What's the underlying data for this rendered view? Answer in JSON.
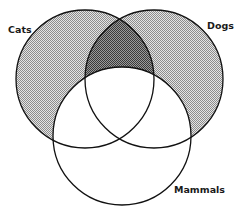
{
  "diagram": {
    "type": "venn",
    "sets": [
      {
        "id": "cats",
        "label": "Cats",
        "shaded": true
      },
      {
        "id": "dogs",
        "label": "Dogs",
        "shaded": true
      },
      {
        "id": "mammals",
        "label": "Mammals",
        "shaded": false
      }
    ],
    "regions": [
      {
        "sets": [
          "cats"
        ],
        "shading": "light"
      },
      {
        "sets": [
          "dogs"
        ],
        "shading": "light"
      },
      {
        "sets": [
          "cats",
          "dogs"
        ],
        "shading": "dark"
      },
      {
        "sets": [
          "mammals"
        ],
        "shading": "none"
      }
    ],
    "colors": {
      "outline": "#111111",
      "light_shade": "#bdbdbd",
      "dark_shade": "#6e6e6e",
      "background": "#ffffff"
    }
  }
}
